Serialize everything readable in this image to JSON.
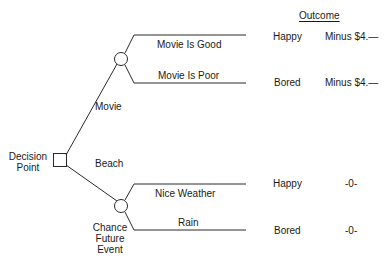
{
  "outcome_header": "Outcome",
  "decision_point": {
    "line1": "Decision",
    "line2": "Point"
  },
  "chance_event": {
    "line1": "Chance",
    "line2": "Future",
    "line3": "Event"
  },
  "choices": {
    "movie": "Movie",
    "beach": "Beach"
  },
  "branches": [
    {
      "event": "Movie Is Good",
      "feeling": "Happy",
      "value": "Minus $4.—"
    },
    {
      "event": "Movie Is Poor",
      "feeling": "Bored",
      "value": "Minus $4.—"
    },
    {
      "event": "Nice Weather",
      "feeling": "Happy",
      "value": "-0-"
    },
    {
      "event": "Rain",
      "feeling": "Bored",
      "value": "-0-"
    }
  ],
  "colors": {
    "line": "#2a2a2a",
    "text": "#1a1a1a",
    "background": "#ffffff"
  }
}
